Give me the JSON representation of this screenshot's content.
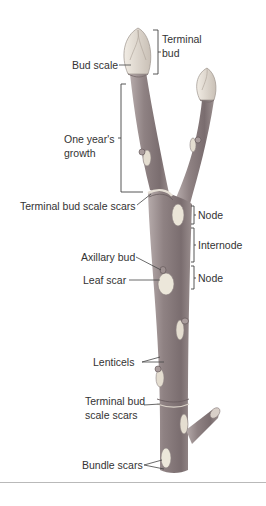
{
  "diagram": {
    "labels": {
      "terminal_bud_1": "Terminal",
      "terminal_bud_2": "bud",
      "bud_scale": "Bud scale",
      "one_year_growth_1": "One year's",
      "one_year_growth_2": "growth",
      "terminal_bud_scale_scars_top": "Terminal bud scale scars",
      "node_upper": "Node",
      "internode": "Internode",
      "axillary_bud": "Axillary bud",
      "leaf_scar": "Leaf scar",
      "node_lower": "Node",
      "lenticels": "Lenticels",
      "terminal_bud_scale_scars_bottom_1": "Terminal bud",
      "terminal_bud_scale_scars_bottom_2": "scale scars",
      "bundle_scars": "Bundle scars"
    },
    "colors": {
      "bark": "#8d7f80",
      "bark_dark": "#6f6264",
      "bark_light": "#b3a8a8",
      "bud": "#e4ddd2",
      "scar": "#ece7da",
      "leader_line": "#444444",
      "rule": "#b9b9b9"
    }
  }
}
